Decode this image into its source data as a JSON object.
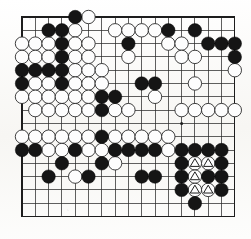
{
  "document": {
    "type": "go-board-diagram",
    "title": "Go board position diagram",
    "board_size": 17,
    "background_color": "#fbfbf9",
    "line_color": "#2b2b2b",
    "black_stone_color": "#151515",
    "white_stone_color": "#fdfdfd"
  },
  "board": {
    "origin_x": 22,
    "origin_y": 17,
    "spacing": 13.3,
    "columns": 17,
    "rows": 16,
    "star_points": [
      {
        "col": 12,
        "row": 8
      }
    ],
    "legend": {
      "black_label": "Black stone",
      "white_label": "White stone",
      "triangle_label": "Marked white stone"
    }
  },
  "stones": {
    "black": [
      {
        "col": 4,
        "row": 0
      },
      {
        "col": 2,
        "row": 1
      },
      {
        "col": 3,
        "row": 1
      },
      {
        "col": 11,
        "row": 1
      },
      {
        "col": 13,
        "row": 1
      },
      {
        "col": 3,
        "row": 2
      },
      {
        "col": 8,
        "row": 2
      },
      {
        "col": 14,
        "row": 2
      },
      {
        "col": 15,
        "row": 2
      },
      {
        "col": 16,
        "row": 2
      },
      {
        "col": 3,
        "row": 3
      },
      {
        "col": 16,
        "row": 3
      },
      {
        "col": 0,
        "row": 4
      },
      {
        "col": 1,
        "row": 4
      },
      {
        "col": 2,
        "row": 4
      },
      {
        "col": 3,
        "row": 4
      },
      {
        "col": 0,
        "row": 5
      },
      {
        "col": 3,
        "row": 5
      },
      {
        "col": 9,
        "row": 5
      },
      {
        "col": 10,
        "row": 5
      },
      {
        "col": 6,
        "row": 6
      },
      {
        "col": 7,
        "row": 6
      },
      {
        "col": 6,
        "row": 7
      },
      {
        "col": 6,
        "row": 9
      },
      {
        "col": 0,
        "row": 10
      },
      {
        "col": 1,
        "row": 10
      },
      {
        "col": 4,
        "row": 10
      },
      {
        "col": 7,
        "row": 10
      },
      {
        "col": 8,
        "row": 10
      },
      {
        "col": 9,
        "row": 10
      },
      {
        "col": 10,
        "row": 10
      },
      {
        "col": 12,
        "row": 10
      },
      {
        "col": 13,
        "row": 10
      },
      {
        "col": 14,
        "row": 10
      },
      {
        "col": 15,
        "row": 10
      },
      {
        "col": 12,
        "row": 11
      },
      {
        "col": 15,
        "row": 11
      },
      {
        "col": 3,
        "row": 11
      },
      {
        "col": 6,
        "row": 11
      },
      {
        "col": 9,
        "row": 12
      },
      {
        "col": 10,
        "row": 12
      },
      {
        "col": 12,
        "row": 12
      },
      {
        "col": 14,
        "row": 12
      },
      {
        "col": 15,
        "row": 12
      },
      {
        "col": 2,
        "row": 12
      },
      {
        "col": 5,
        "row": 12
      },
      {
        "col": 12,
        "row": 13
      },
      {
        "col": 15,
        "row": 13
      },
      {
        "col": 13,
        "row": 14
      }
    ],
    "white": [
      {
        "col": 5,
        "row": 0
      },
      {
        "col": 4,
        "row": 1
      },
      {
        "col": 7,
        "row": 1
      },
      {
        "col": 8,
        "row": 1
      },
      {
        "col": 9,
        "row": 1
      },
      {
        "col": 10,
        "row": 1
      },
      {
        "col": 0,
        "row": 2
      },
      {
        "col": 1,
        "row": 2
      },
      {
        "col": 2,
        "row": 2
      },
      {
        "col": 4,
        "row": 2
      },
      {
        "col": 5,
        "row": 2
      },
      {
        "col": 11,
        "row": 2
      },
      {
        "col": 12,
        "row": 2
      },
      {
        "col": 0,
        "row": 3
      },
      {
        "col": 1,
        "row": 3
      },
      {
        "col": 2,
        "row": 3
      },
      {
        "col": 4,
        "row": 3
      },
      {
        "col": 5,
        "row": 3
      },
      {
        "col": 8,
        "row": 3
      },
      {
        "col": 12,
        "row": 3
      },
      {
        "col": 13,
        "row": 3
      },
      {
        "col": 4,
        "row": 4
      },
      {
        "col": 5,
        "row": 4
      },
      {
        "col": 6,
        "row": 4
      },
      {
        "col": 16,
        "row": 4
      },
      {
        "col": 1,
        "row": 5
      },
      {
        "col": 2,
        "row": 5
      },
      {
        "col": 4,
        "row": 5
      },
      {
        "col": 5,
        "row": 5
      },
      {
        "col": 6,
        "row": 5
      },
      {
        "col": 13,
        "row": 5
      },
      {
        "col": 0,
        "row": 6
      },
      {
        "col": 1,
        "row": 6
      },
      {
        "col": 2,
        "row": 6
      },
      {
        "col": 3,
        "row": 6
      },
      {
        "col": 4,
        "row": 6
      },
      {
        "col": 5,
        "row": 6
      },
      {
        "col": 10,
        "row": 6
      },
      {
        "col": 1,
        "row": 7
      },
      {
        "col": 2,
        "row": 7
      },
      {
        "col": 3,
        "row": 7
      },
      {
        "col": 4,
        "row": 7
      },
      {
        "col": 5,
        "row": 7
      },
      {
        "col": 7,
        "row": 7
      },
      {
        "col": 8,
        "row": 7
      },
      {
        "col": 12,
        "row": 7
      },
      {
        "col": 13,
        "row": 7
      },
      {
        "col": 14,
        "row": 7
      },
      {
        "col": 15,
        "row": 7
      },
      {
        "col": 16,
        "row": 7
      },
      {
        "col": 0,
        "row": 9
      },
      {
        "col": 1,
        "row": 9
      },
      {
        "col": 2,
        "row": 9
      },
      {
        "col": 3,
        "row": 9
      },
      {
        "col": 4,
        "row": 9
      },
      {
        "col": 5,
        "row": 9
      },
      {
        "col": 7,
        "row": 9
      },
      {
        "col": 8,
        "row": 9
      },
      {
        "col": 9,
        "row": 9
      },
      {
        "col": 10,
        "row": 9
      },
      {
        "col": 11,
        "row": 9
      },
      {
        "col": 2,
        "row": 10
      },
      {
        "col": 3,
        "row": 10
      },
      {
        "col": 5,
        "row": 10
      },
      {
        "col": 6,
        "row": 10
      },
      {
        "col": 11,
        "row": 10
      },
      {
        "col": 13,
        "row": 11
      },
      {
        "col": 14,
        "row": 11
      },
      {
        "col": 7,
        "row": 11
      },
      {
        "col": 13,
        "row": 12
      },
      {
        "col": 4,
        "row": 12
      },
      {
        "col": 13,
        "row": 13
      },
      {
        "col": 14,
        "row": 13
      }
    ],
    "white_marked_triangle": [
      {
        "col": 13,
        "row": 11
      },
      {
        "col": 14,
        "row": 11
      },
      {
        "col": 12,
        "row": 12
      },
      {
        "col": 13,
        "row": 12
      },
      {
        "col": 13,
        "row": 13
      },
      {
        "col": 14,
        "row": 13
      }
    ]
  }
}
